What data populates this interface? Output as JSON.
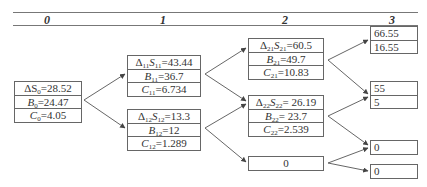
{
  "header": {
    "columns": [
      "0",
      "1",
      "2",
      "3"
    ]
  },
  "nodes": {
    "n0": {
      "rows": [
        {
          "sym": "ΔS",
          "sub": "0",
          "val": "=28.52"
        },
        {
          "sym": "B",
          "sub": "0",
          "val": "=24.47"
        },
        {
          "sym": "C",
          "sub": "0",
          "val": "=4.05"
        }
      ]
    },
    "n11": {
      "rows": [
        {
          "pre": "Δ",
          "presub": "11",
          "sym": "S",
          "sub": "11",
          "val": "=43.44"
        },
        {
          "sym": "B",
          "sub": "11",
          "val": "=36.7"
        },
        {
          "sym": "C",
          "sub": "11",
          "val": "=6.734"
        }
      ]
    },
    "n12": {
      "rows": [
        {
          "pre": "Δ",
          "presub": "12",
          "sym": "S",
          "sub": "12",
          "val": "=13.3"
        },
        {
          "sym": "B",
          "sub": "12",
          "val": "=12"
        },
        {
          "sym": "C",
          "sub": "12",
          "val": "=1.289"
        }
      ]
    },
    "n21": {
      "rows": [
        {
          "pre": "Δ",
          "presub": "21",
          "sym": "S",
          "sub": "21",
          "val": "=60.5"
        },
        {
          "sym": "B",
          "sub": "21",
          "val": "=49.7"
        },
        {
          "sym": "C",
          "sub": "21",
          "val": "=10.83"
        }
      ]
    },
    "n22": {
      "rows": [
        {
          "pre": "Δ",
          "presub": "22",
          "sym": "S",
          "sub": "22",
          "val": "= 26.19"
        },
        {
          "sym": "B",
          "sub": "22",
          "val": "= 23.7"
        },
        {
          "sym": "C",
          "sub": "22",
          "val": "=2.539"
        }
      ]
    },
    "n23": {
      "value": "0"
    },
    "n31": {
      "values": [
        "66.55",
        "16.55"
      ]
    },
    "n32": {
      "values": [
        "55",
        "5"
      ]
    },
    "n33": {
      "value": "0"
    },
    "n34": {
      "value": "0"
    }
  },
  "edges": [
    [
      "n0",
      "n11"
    ],
    [
      "n0",
      "n12"
    ],
    [
      "n11",
      "n21"
    ],
    [
      "n11",
      "n22"
    ],
    [
      "n12",
      "n22"
    ],
    [
      "n12",
      "n23"
    ],
    [
      "n21",
      "n31"
    ],
    [
      "n21",
      "n32"
    ],
    [
      "n22",
      "n32"
    ],
    [
      "n22",
      "n33"
    ],
    [
      "n23",
      "n33"
    ],
    [
      "n23",
      "n34"
    ]
  ]
}
